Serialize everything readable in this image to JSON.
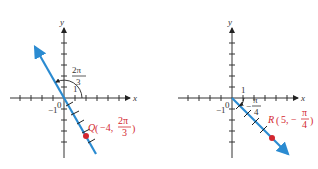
{
  "figure": {
    "left": {
      "x_label": "x",
      "y_label": "y",
      "origin_label": "0",
      "neg_one_label": "−1",
      "one_label": "1",
      "angle": {
        "num": "2π",
        "den": "3"
      },
      "point": {
        "name": "Q",
        "r": "−4,",
        "theta_num": "2π",
        "theta_den": "3"
      },
      "line_color": "#2b8bd1",
      "point_color": "#d3272f"
    },
    "right": {
      "x_label": "x",
      "y_label": "y",
      "origin_label": "0",
      "neg_one_label": "−1",
      "one_label": "1",
      "angle": {
        "sign": "−",
        "num": "π",
        "den": "4"
      },
      "point": {
        "name": "R",
        "r": "5, −",
        "theta_num": "π",
        "theta_den": "4"
      },
      "line_color": "#2b8bd1",
      "point_color": "#d3272f"
    }
  }
}
